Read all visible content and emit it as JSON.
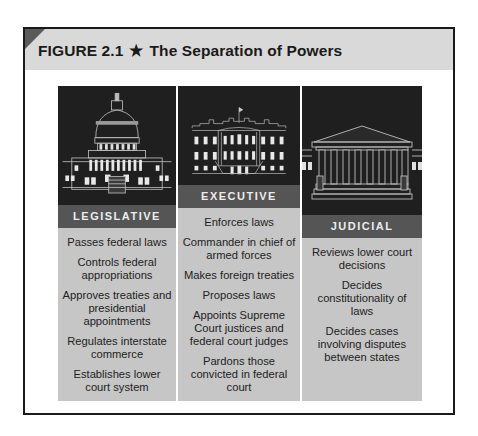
{
  "figure": {
    "label": "FIGURE 2.1",
    "star": "★",
    "title": "The Separation of Powers"
  },
  "colors": {
    "title_bar": "#d9d9d9",
    "art_bg": "#1f1f1f",
    "label_band": "#555555",
    "text_area": "#c6c6c6"
  },
  "branches": [
    {
      "name": "LEGISLATIVE",
      "icon": "capitol-building-icon",
      "powers": [
        "Passes federal laws",
        "Controls federal appropriations",
        "Approves treaties and presidential appointments",
        "Regulates interstate commerce",
        "Establishes lower court system"
      ]
    },
    {
      "name": "EXECUTIVE",
      "icon": "white-house-icon",
      "powers": [
        "Enforces laws",
        "Commander in chief of armed forces",
        "Makes foreign treaties",
        "Proposes laws",
        "Appoints Supreme Court justices and federal court judges",
        "Pardons those convicted in federal court"
      ]
    },
    {
      "name": "JUDICIAL",
      "icon": "supreme-court-icon",
      "powers": [
        "Reviews lower court decisions",
        "Decides constitutionality of laws",
        "Decides cases involving disputes between states"
      ]
    }
  ]
}
